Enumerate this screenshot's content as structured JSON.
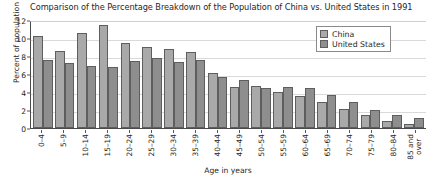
{
  "chart_data": {
    "type": "bar",
    "title": "Comparison of the Percentage Breakdown of the Population of China vs. United States in 1991",
    "xlabel": "Age in years",
    "ylabel": "Percent of population",
    "ylim": [
      0,
      12
    ],
    "yticks": [
      0,
      2,
      4,
      6,
      8,
      10,
      12
    ],
    "grid": true,
    "legend_position": "top-right",
    "categories": [
      "0–4",
      "5–9",
      "10–14",
      "15–19",
      "20–24",
      "25–29",
      "30–34",
      "35–39",
      "40–44",
      "45–49",
      "50–54",
      "55–59",
      "60–64",
      "65–69",
      "70–74",
      "75–79",
      "80–84",
      "85 and over"
    ],
    "series": [
      {
        "name": "China",
        "color": "#a9a9a9",
        "values": [
          10.2,
          8.6,
          10.6,
          11.4,
          9.4,
          9.0,
          8.8,
          8.5,
          6.1,
          4.6,
          4.7,
          4.0,
          3.6,
          2.9,
          2.1,
          1.5,
          0.8,
          0.5
        ]
      },
      {
        "name": "United States",
        "color": "#8e8e8e",
        "values": [
          7.6,
          7.2,
          6.9,
          6.8,
          7.4,
          7.8,
          7.3,
          7.6,
          5.7,
          5.3,
          4.5,
          4.6,
          4.5,
          3.7,
          2.9,
          2.0,
          1.5,
          1.1
        ]
      }
    ]
  },
  "legend": {
    "items": [
      {
        "label": "China",
        "swatch": "china"
      },
      {
        "label": "United States",
        "swatch": "us"
      }
    ]
  }
}
